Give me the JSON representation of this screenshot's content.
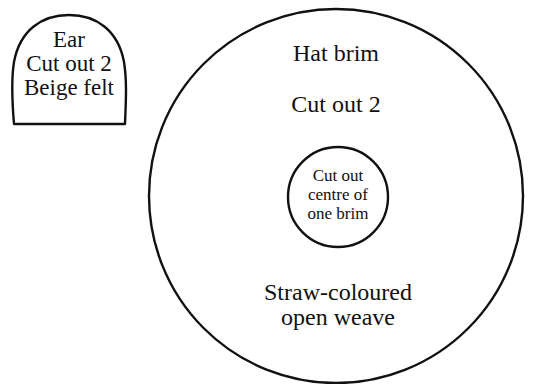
{
  "diagram": {
    "ear_piece": {
      "lines": [
        "Ear",
        "Cut out 2",
        "Beige felt"
      ]
    },
    "hat_brim": {
      "title": "Hat brim",
      "instruction": "Cut out 2",
      "material_lines": [
        "Straw-coloured",
        "open weave"
      ],
      "centre_cutout": {
        "lines": [
          "Cut out",
          "centre of",
          "one brim"
        ]
      }
    },
    "colors": {
      "stroke": "#111111",
      "background": "#ffffff"
    }
  }
}
